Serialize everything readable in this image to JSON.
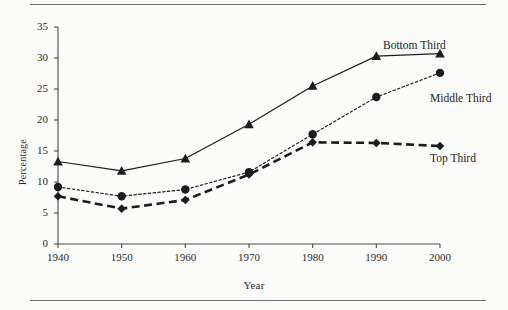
{
  "chart_data": {
    "type": "line",
    "title": "",
    "xlabel": "Year",
    "ylabel": "Percentage",
    "x": [
      1940,
      1950,
      1960,
      1970,
      1980,
      1990,
      2000
    ],
    "xlim": [
      1940,
      2000
    ],
    "ylim": [
      0,
      35
    ],
    "xticks": [
      "1940",
      "1950",
      "1960",
      "1970",
      "1980",
      "1990",
      "2000"
    ],
    "yticks": [
      "0",
      "5",
      "10",
      "15",
      "20",
      "25",
      "30",
      "35"
    ],
    "grid": false,
    "legend_position": "inline-right",
    "series": [
      {
        "name": "Bottom Third",
        "marker": "triangle",
        "linestyle": "solid",
        "color": "#1c1c1c",
        "values": [
          13.3,
          11.8,
          13.8,
          19.3,
          25.5,
          30.3,
          30.7
        ]
      },
      {
        "name": "Middle Third",
        "marker": "circle",
        "linestyle": "dotted",
        "color": "#1c1c1c",
        "values": [
          9.2,
          7.7,
          8.8,
          11.6,
          17.7,
          23.7,
          27.6
        ]
      },
      {
        "name": "Top Third",
        "marker": "diamond",
        "linestyle": "dashed",
        "color": "#1c1c1c",
        "values": [
          7.7,
          5.7,
          7.1,
          11.2,
          16.4,
          16.3,
          15.8
        ]
      }
    ]
  }
}
